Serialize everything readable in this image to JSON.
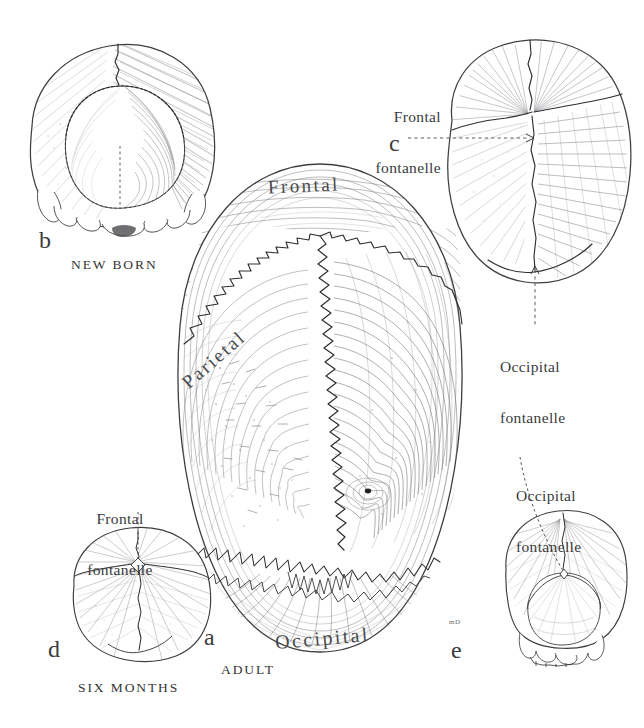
{
  "plate": {
    "title": "Development of the skull vault and fontanelles",
    "background_color": "#ffffff",
    "ink_color": "#3a3a3c",
    "artist_monogram": "mD"
  },
  "figures": [
    {
      "id": "a",
      "letter": "a",
      "caption": "ADULT",
      "view": "superior view of adult calvaria",
      "bone_labels": [
        {
          "name": "frontal",
          "text": "Frontal"
        },
        {
          "name": "parietal",
          "text": "Parietal"
        },
        {
          "name": "occipital",
          "text": "Occipital"
        }
      ]
    },
    {
      "id": "b",
      "letter": "b",
      "caption": "NEW BORN",
      "view": "posterior view of newborn skull",
      "bone_labels": [],
      "callouts": []
    },
    {
      "id": "c",
      "letter": "c",
      "caption": "",
      "view": "superior view of newborn skull",
      "callouts": [
        {
          "name": "frontal-fontanelle",
          "line1": "Frontal",
          "line2": "fontanelle"
        },
        {
          "name": "occipital-fontanelle",
          "line1": "Occipital",
          "line2": "fontanelle"
        }
      ]
    },
    {
      "id": "d",
      "letter": "d",
      "caption": "SIX MONTHS",
      "view": "superior view of six month skull",
      "callouts": [
        {
          "name": "frontal-fontanelle",
          "line1": "Frontal",
          "line2": "fontanelle"
        }
      ]
    },
    {
      "id": "e",
      "letter": "e",
      "caption": "",
      "view": "posterior view of infant skull",
      "callouts": [
        {
          "name": "occipital-fontanelle",
          "line1": "Occipital",
          "line2": "fontanelle"
        }
      ]
    }
  ]
}
